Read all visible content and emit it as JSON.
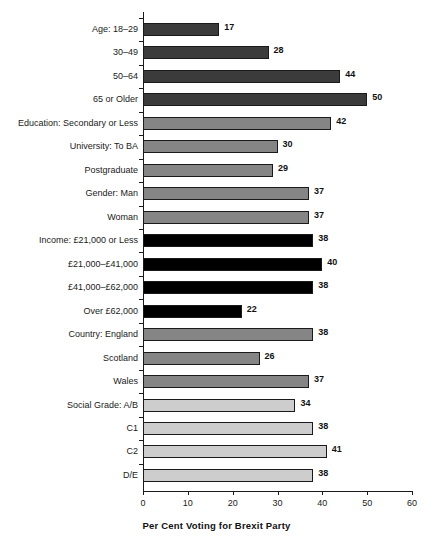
{
  "chart_data": {
    "type": "bar",
    "orientation": "horizontal",
    "title": "",
    "xlabel": "Per Cent Voting for Brexit Party",
    "ylabel": "",
    "xlim": [
      0,
      60
    ],
    "xticks": [
      "0",
      "10",
      "20",
      "30",
      "40",
      "50",
      "60"
    ],
    "grid": false,
    "legend": "none",
    "categories": [
      "Age: 18–29",
      "30–49",
      "50–64",
      "65 or Older",
      "Education: Secondary or Less",
      "University: To BA",
      "Postgraduate",
      "Gender: Man",
      "Woman",
      "Income: £21,000 or Less",
      "£21,000–£41,000",
      "£41,000–£62,000",
      "Over £62,000",
      "Country: England",
      "Scotland",
      "Wales",
      "Social Grade: A/B",
      "C1",
      "C2",
      "D/E"
    ],
    "values": [
      17,
      28,
      44,
      50,
      42,
      30,
      29,
      37,
      37,
      38,
      40,
      38,
      22,
      38,
      26,
      37,
      34,
      38,
      41,
      38
    ],
    "bar_colors": [
      "#3b3b3b",
      "#3b3b3b",
      "#3b3b3b",
      "#3b3b3b",
      "#858585",
      "#858585",
      "#858585",
      "#858585",
      "#858585",
      "#000000",
      "#000000",
      "#000000",
      "#000000",
      "#858585",
      "#858585",
      "#858585",
      "#cdcdcd",
      "#cdcdcd",
      "#cdcdcd",
      "#cdcdcd"
    ],
    "bar_fill_classes": [
      "fill-dark",
      "fill-dark",
      "fill-dark",
      "fill-dark",
      "fill-mid",
      "fill-mid",
      "fill-mid",
      "fill-mid",
      "fill-mid",
      "fill-black",
      "fill-black",
      "fill-black",
      "fill-black",
      "fill-mid",
      "fill-mid",
      "fill-mid",
      "fill-light",
      "fill-light",
      "fill-light",
      "fill-light"
    ],
    "groups": [
      {
        "name": "Age",
        "indices": [
          0,
          1,
          2,
          3
        ]
      },
      {
        "name": "Education",
        "indices": [
          4,
          5,
          6
        ]
      },
      {
        "name": "Gender",
        "indices": [
          7,
          8
        ]
      },
      {
        "name": "Income",
        "indices": [
          9,
          10,
          11,
          12
        ]
      },
      {
        "name": "Country",
        "indices": [
          13,
          14,
          15
        ]
      },
      {
        "name": "Social Grade",
        "indices": [
          16,
          17,
          18,
          19
        ]
      }
    ]
  },
  "colors": {
    "axis": "#1a1a1a",
    "text": "#1a1a1a",
    "value_text": "#111111",
    "background": "#ffffff"
  }
}
